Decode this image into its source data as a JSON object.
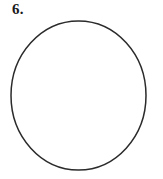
{
  "figure": {
    "title_label": "6.",
    "background_color": "#ffffff",
    "stroke_color": "#2b2b2b",
    "stroke_width": 1.5,
    "shape": {
      "name": "circle",
      "center_x": 78.5,
      "center_y": 95.5,
      "radius_x": 67.5,
      "radius_y": 74.5,
      "fill": "none"
    }
  }
}
